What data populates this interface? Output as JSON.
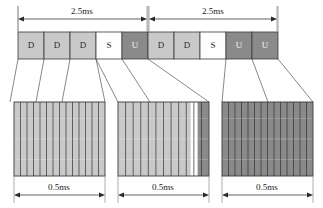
{
  "diagram": {
    "colors": {
      "downlink_fill": "#c9c9c9",
      "special_fill": "#fefefe",
      "uplink_fill": "#8a8a8a",
      "outline": "#3a3a3a",
      "leader_line": "#666666",
      "text": "#1a1a1a",
      "stripe": "#2f2f2f"
    },
    "top_dimensions": [
      {
        "label": "2.5ms",
        "x1": 18,
        "x2": 147,
        "text_x": 82
      },
      {
        "label": "2.5ms",
        "x1": 149,
        "x2": 277,
        "text_x": 213
      }
    ],
    "slots": [
      {
        "label": "D",
        "type": "downlink",
        "x": 18,
        "w": 26
      },
      {
        "label": "D",
        "type": "downlink",
        "x": 44,
        "w": 26
      },
      {
        "label": "D",
        "type": "downlink",
        "x": 70,
        "w": 26
      },
      {
        "label": "S",
        "type": "special",
        "x": 96,
        "w": 26
      },
      {
        "label": "U",
        "type": "uplink",
        "x": 122,
        "w": 26
      },
      {
        "label": "D",
        "type": "downlink",
        "x": 148,
        "w": 26
      },
      {
        "label": "D",
        "type": "downlink",
        "x": 174,
        "w": 26
      },
      {
        "label": "S",
        "type": "special",
        "x": 200,
        "w": 26
      },
      {
        "label": "U",
        "type": "uplink",
        "x": 226,
        "w": 26
      },
      {
        "label": "U",
        "type": "uplink",
        "x": 252,
        "w": 26
      }
    ],
    "slot_row": {
      "y": 32,
      "height": 27
    },
    "detail_boxes": [
      {
        "name": "downlink-detail",
        "x": 14,
        "y": 102,
        "w": 91,
        "h": 74,
        "dimension": "0.5ms",
        "bands": [
          {
            "fill": "#c9c9c9",
            "start": 0.0,
            "end": 1.0
          }
        ],
        "stripe_count": 14
      },
      {
        "name": "special-slot-detail",
        "x": 118,
        "y": 102,
        "w": 91,
        "h": 74,
        "dimension": "0.5ms",
        "bands": [
          {
            "fill": "#c9c9c9",
            "start": 0.0,
            "end": 0.8
          },
          {
            "fill": "#fefefe",
            "start": 0.8,
            "end": 0.875
          },
          {
            "fill": "#8a8a8a",
            "start": 0.875,
            "end": 1.0
          }
        ],
        "stripe_count": 12
      },
      {
        "name": "uplink-detail",
        "x": 222,
        "y": 102,
        "w": 91,
        "h": 74,
        "dimension": "0.5ms",
        "bands": [
          {
            "fill": "#8a8a8a",
            "start": 0.0,
            "end": 1.0
          }
        ],
        "stripe_count": 14
      }
    ],
    "bottom_dimensions": [
      {
        "label": "0.5ms",
        "x1": 14,
        "x2": 105,
        "text_x": 59
      },
      {
        "label": "0.5ms",
        "x1": 118,
        "x2": 209,
        "text_x": 163
      },
      {
        "label": "0.5ms",
        "x1": 222,
        "x2": 313,
        "text_x": 267
      }
    ]
  }
}
